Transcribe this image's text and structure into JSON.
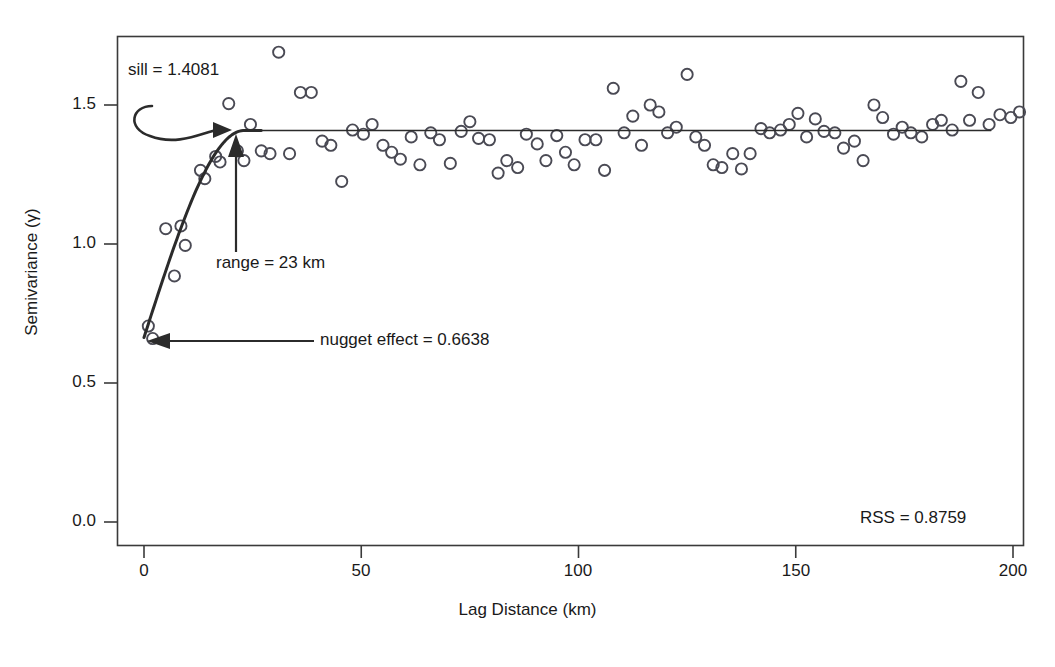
{
  "chart_data": {
    "type": "scatter",
    "title": "",
    "xlabel": "Lag Distance (km)",
    "ylabel": "Semivariance (γ)",
    "xlim": [
      0,
      207
    ],
    "ylim": [
      0,
      1.75
    ],
    "xticks": [
      0,
      50,
      100,
      150,
      200
    ],
    "xtick_labels": [
      "0",
      "50",
      "100",
      "150",
      "200"
    ],
    "yticks": [
      0.0,
      0.5,
      1.0,
      1.5
    ],
    "ytick_labels": [
      "0.0",
      "0.5",
      "1.0",
      "1.5"
    ],
    "grid": false,
    "legend": "none",
    "model": {
      "name": "spherical",
      "nugget": 0.6638,
      "sill": 1.4081,
      "range_km": 23,
      "rss": 0.8759
    },
    "series": [
      {
        "name": "empirical semivariance",
        "marker": "open-circle",
        "points": [
          [
            1.0,
            0.705
          ],
          [
            2.0,
            0.66
          ],
          [
            5.0,
            1.055
          ],
          [
            7.0,
            0.885
          ],
          [
            8.5,
            1.065
          ],
          [
            9.5,
            0.995
          ],
          [
            13.0,
            1.265
          ],
          [
            14.0,
            1.235
          ],
          [
            16.5,
            1.315
          ],
          [
            17.5,
            1.295
          ],
          [
            19.5,
            1.505
          ],
          [
            21.5,
            1.335
          ],
          [
            23.0,
            1.3
          ],
          [
            24.5,
            1.43
          ],
          [
            27.0,
            1.335
          ],
          [
            29.0,
            1.325
          ],
          [
            31.0,
            1.69
          ],
          [
            33.5,
            1.325
          ],
          [
            36.0,
            1.545
          ],
          [
            38.5,
            1.545
          ],
          [
            41.0,
            1.37
          ],
          [
            43.0,
            1.355
          ],
          [
            45.5,
            1.225
          ],
          [
            48.0,
            1.41
          ],
          [
            50.5,
            1.395
          ],
          [
            52.5,
            1.43
          ],
          [
            55.0,
            1.355
          ],
          [
            57.0,
            1.33
          ],
          [
            59.0,
            1.305
          ],
          [
            61.5,
            1.385
          ],
          [
            63.5,
            1.285
          ],
          [
            66.0,
            1.4
          ],
          [
            68.0,
            1.375
          ],
          [
            70.5,
            1.29
          ],
          [
            73.0,
            1.405
          ],
          [
            75.0,
            1.44
          ],
          [
            77.0,
            1.38
          ],
          [
            79.5,
            1.375
          ],
          [
            81.5,
            1.255
          ],
          [
            83.5,
            1.3
          ],
          [
            86.0,
            1.275
          ],
          [
            88.0,
            1.395
          ],
          [
            90.5,
            1.36
          ],
          [
            92.5,
            1.3
          ],
          [
            95.0,
            1.39
          ],
          [
            97.0,
            1.33
          ],
          [
            99.0,
            1.285
          ],
          [
            101.5,
            1.375
          ],
          [
            104.0,
            1.375
          ],
          [
            106.0,
            1.265
          ],
          [
            108.0,
            1.56
          ],
          [
            110.5,
            1.4
          ],
          [
            112.5,
            1.46
          ],
          [
            114.5,
            1.355
          ],
          [
            116.5,
            1.5
          ],
          [
            118.5,
            1.475
          ],
          [
            120.5,
            1.4
          ],
          [
            122.5,
            1.42
          ],
          [
            125.0,
            1.61
          ],
          [
            127.0,
            1.385
          ],
          [
            129.0,
            1.355
          ],
          [
            131.0,
            1.285
          ],
          [
            133.0,
            1.275
          ],
          [
            135.5,
            1.325
          ],
          [
            137.5,
            1.27
          ],
          [
            139.5,
            1.325
          ],
          [
            142.0,
            1.415
          ],
          [
            144.0,
            1.4
          ],
          [
            146.5,
            1.41
          ],
          [
            148.5,
            1.43
          ],
          [
            150.5,
            1.47
          ],
          [
            152.5,
            1.385
          ],
          [
            154.5,
            1.45
          ],
          [
            156.5,
            1.405
          ],
          [
            159.0,
            1.4
          ],
          [
            161.0,
            1.345
          ],
          [
            163.5,
            1.37
          ],
          [
            165.5,
            1.3
          ],
          [
            168.0,
            1.5
          ],
          [
            170.0,
            1.455
          ],
          [
            172.5,
            1.395
          ],
          [
            174.5,
            1.42
          ],
          [
            176.5,
            1.4
          ],
          [
            179.0,
            1.385
          ],
          [
            181.5,
            1.43
          ],
          [
            183.5,
            1.445
          ],
          [
            186.0,
            1.41
          ],
          [
            188.0,
            1.585
          ],
          [
            190.0,
            1.445
          ],
          [
            192.0,
            1.545
          ],
          [
            194.5,
            1.43
          ],
          [
            197.0,
            1.465
          ],
          [
            199.5,
            1.455
          ],
          [
            201.5,
            1.475
          ]
        ]
      }
    ],
    "annotations": [
      {
        "id": "sill",
        "label": "sill = 1.4081",
        "value": 1.4081,
        "arrow": "curved-right"
      },
      {
        "id": "range",
        "label": "range = 23 km",
        "value": 23,
        "arrow": "up"
      },
      {
        "id": "nugget",
        "label": "nugget effect = 0.6638",
        "value": 0.6638,
        "arrow": "left"
      },
      {
        "id": "rss",
        "label": "RSS = 0.8759",
        "value": 0.8759,
        "arrow": "none"
      }
    ]
  },
  "axes": {
    "x_title": "Lag Distance (km)",
    "y_title": "Semivariance (γ)",
    "x_ticks": [
      "0",
      "50",
      "100",
      "150",
      "200"
    ],
    "y_ticks": [
      "1.5",
      "1.0",
      "0.5",
      "0.0"
    ]
  },
  "labels": {
    "sill": "sill = 1.4081",
    "range": "range = 23 km",
    "nugget": "nugget effect = 0.6638",
    "rss": "RSS = 0.8759"
  },
  "colors": {
    "ink": "#2b2b2b",
    "marker_stroke": "#4a4a54",
    "frame": "#3a3a3a",
    "background": "#ffffff"
  }
}
